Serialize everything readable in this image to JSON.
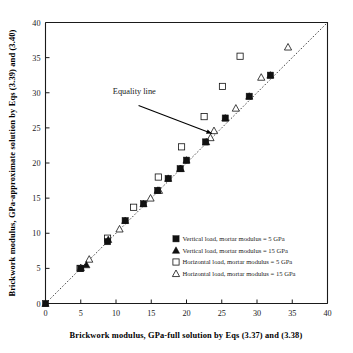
{
  "chart_data": {
    "type": "scatter",
    "title": "",
    "xlabel": "Brickwork modulus, GPa-full solution by Eqs (3.37) and (3.38)",
    "ylabel": "Brickwork modulus, GPa-approximate solution by Eqs (3.39) and (3.40)",
    "xlim": [
      0,
      40
    ],
    "ylim": [
      0,
      40
    ],
    "xticks": [
      0,
      5,
      10,
      15,
      20,
      25,
      30,
      35,
      40
    ],
    "yticks": [
      0,
      5,
      10,
      15,
      20,
      25,
      30,
      35,
      40
    ],
    "grid": false,
    "legend_position": "inside-lower-right",
    "annotations": [
      {
        "text": "Equality line",
        "x": 12.6,
        "y": 29.8,
        "arrow_from_x": 13.2,
        "arrow_from_y": 28.2,
        "arrow_to_x": 23.6,
        "arrow_to_y": 24.2
      }
    ],
    "reference_line": {
      "name": "Equality line",
      "style": "dashed",
      "from": [
        0,
        0
      ],
      "to": [
        40,
        40
      ]
    },
    "series": [
      {
        "name": "Vertical load, mortar modulus = 5 GPa",
        "marker": "filled-square",
        "points": [
          [
            0.0,
            0.0
          ],
          [
            5.0,
            5.0
          ],
          [
            8.8,
            8.8
          ],
          [
            11.3,
            11.8
          ],
          [
            13.9,
            14.2
          ],
          [
            15.9,
            16.1
          ],
          [
            17.4,
            17.8
          ],
          [
            19.1,
            19.2
          ],
          [
            20.0,
            20.4
          ],
          [
            22.7,
            23.0
          ],
          [
            25.5,
            26.4
          ],
          [
            28.9,
            29.5
          ],
          [
            31.9,
            32.5
          ]
        ]
      },
      {
        "name": "Vertical load, mortar modulus = 15 GPa",
        "marker": "filled-triangle",
        "points": [
          [
            0.0,
            0.0
          ],
          [
            5.8,
            5.5
          ],
          [
            8.9,
            9.1
          ],
          [
            11.3,
            11.8
          ],
          [
            13.9,
            14.2
          ],
          [
            15.9,
            16.1
          ],
          [
            17.4,
            17.8
          ],
          [
            19.2,
            19.2
          ],
          [
            20.0,
            20.4
          ],
          [
            22.8,
            23.0
          ],
          [
            25.5,
            26.4
          ],
          [
            28.9,
            29.5
          ],
          [
            31.9,
            32.5
          ]
        ]
      },
      {
        "name": "Horizontal load, mortar modulus = 5 GPa",
        "marker": "open-square",
        "points": [
          [
            4.9,
            5.0
          ],
          [
            8.8,
            9.3
          ],
          [
            12.5,
            13.7
          ],
          [
            16.0,
            18.0
          ],
          [
            19.3,
            22.3
          ],
          [
            22.5,
            26.6
          ],
          [
            25.1,
            30.9
          ],
          [
            27.6,
            35.2
          ]
        ]
      },
      {
        "name": "Horizontal load, mortar modulus = 15 GPa",
        "marker": "open-triangle",
        "points": [
          [
            5.0,
            5.1
          ],
          [
            6.2,
            6.3
          ],
          [
            10.5,
            10.6
          ],
          [
            14.9,
            15.0
          ],
          [
            16.1,
            16.1
          ],
          [
            19.1,
            19.2
          ],
          [
            23.4,
            23.6
          ],
          [
            23.9,
            24.6
          ],
          [
            27.0,
            27.8
          ],
          [
            30.6,
            32.2
          ],
          [
            34.4,
            36.5
          ]
        ]
      }
    ]
  },
  "legend": {
    "items": [
      {
        "label": "Vertical load, mortar modulus = 5 GPa",
        "marker": "filled-square"
      },
      {
        "label": "Vertical load, mortar modulus = 15 GPa",
        "marker": "filled-triangle"
      },
      {
        "label": "Horizontal load, mortar modulus = 5 GPa",
        "marker": "open-square"
      },
      {
        "label": "Horizontal load, mortar modulus = 15 GPa",
        "marker": "open-triangle"
      }
    ]
  },
  "colors": {
    "axis": "#1a1a1a",
    "marker": "#111111",
    "background": "#ffffff",
    "equality_line": "#333333"
  }
}
